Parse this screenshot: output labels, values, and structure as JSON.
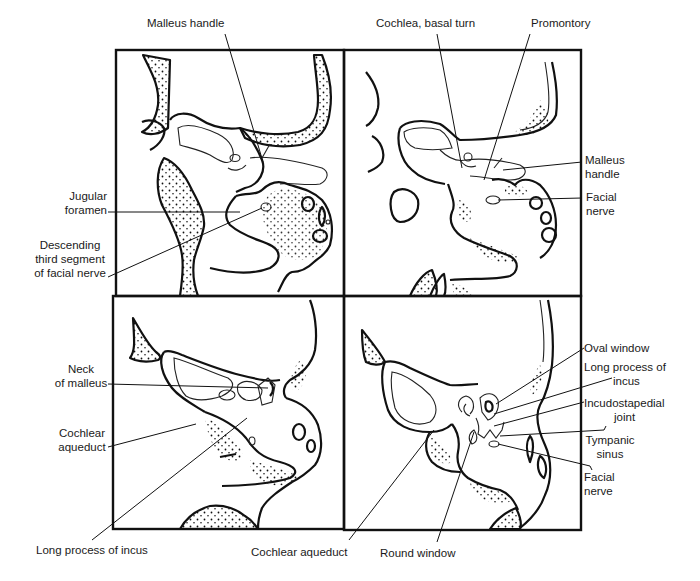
{
  "figure": {
    "type": "anatomical-diagram",
    "panel_count": 4,
    "panels": [
      {
        "id": "top-left",
        "labels": [
          {
            "text": "Malleus handle",
            "position": "top"
          },
          {
            "text": "Jugular\nforamen",
            "position": "left"
          },
          {
            "text": "Descending\nthird segment\nof facial nerve",
            "position": "left"
          }
        ]
      },
      {
        "id": "top-right",
        "labels": [
          {
            "text": "Cochlea, basal turn",
            "position": "top"
          },
          {
            "text": "Promontory",
            "position": "top"
          },
          {
            "text": "Malleus\nhandle",
            "position": "right"
          },
          {
            "text": "Facial\nnerve",
            "position": "right"
          }
        ]
      },
      {
        "id": "bottom-left",
        "labels": [
          {
            "text": "Neck\nof malleus",
            "position": "left"
          },
          {
            "text": "Cochlear\naqueduct",
            "position": "left"
          },
          {
            "text": "Long process of incus",
            "position": "bottom"
          }
        ]
      },
      {
        "id": "bottom-right",
        "labels": [
          {
            "text": "Oval window",
            "position": "right"
          },
          {
            "text": "Long process of\nincus",
            "position": "right"
          },
          {
            "text": "Incudostapedial\njoint",
            "position": "right"
          },
          {
            "text": "Tympanic\nsinus",
            "position": "right"
          },
          {
            "text": "Facial\nnerve",
            "position": "right"
          },
          {
            "text": "Cochlear aqueduct",
            "position": "bottom"
          },
          {
            "text": "Round window",
            "position": "bottom"
          }
        ]
      }
    ]
  },
  "labels": {
    "malleus_handle_top": "Malleus handle",
    "cochlea_basal_turn": "Cochlea, basal turn",
    "promontory": "Promontory",
    "jugular_foramen_1": "Jugular",
    "jugular_foramen_2": "foramen",
    "descending_1": "Descending",
    "descending_2": "third segment",
    "descending_3": "of facial nerve",
    "malleus_handle_right_1": "Malleus",
    "malleus_handle_right_2": "handle",
    "facial_nerve_tr_1": "Facial",
    "facial_nerve_tr_2": "nerve",
    "neck_malleus_1": "Neck",
    "neck_malleus_2": "of malleus",
    "cochlear_aqueduct_bl_1": "Cochlear",
    "cochlear_aqueduct_bl_2": "aqueduct",
    "oval_window": "Oval window",
    "long_process_br_1": "Long process of",
    "long_process_br_2": "incus",
    "incudostapedial_1": "Incudostapedial",
    "incudostapedial_2": "joint",
    "tympanic_sinus_1": "Tympanic",
    "tympanic_sinus_2": "sinus",
    "facial_nerve_br_1": "Facial",
    "facial_nerve_br_2": "nerve",
    "long_process_bottom": "Long process of incus",
    "cochlear_aqueduct_bottom": "Cochlear aqueduct",
    "round_window": "Round window"
  }
}
